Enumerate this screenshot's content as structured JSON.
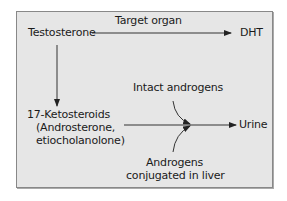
{
  "diagram": {
    "nodes": {
      "testosterone": "Testosterone",
      "dht": "DHT",
      "ketosteroids_line1": "17-Ketosteroids",
      "ketosteroids_line2": "(Androsterone,",
      "ketosteroids_line3": "etiocholanolone)",
      "urine": "Urine"
    },
    "edge_labels": {
      "target_organ": "Target organ",
      "intact_androgens": "Intact androgens",
      "conjugated_line1": "Androgens",
      "conjugated_line2": "conjugated in liver"
    },
    "colors": {
      "background": "#e6e6e6",
      "line": "#333333"
    }
  }
}
